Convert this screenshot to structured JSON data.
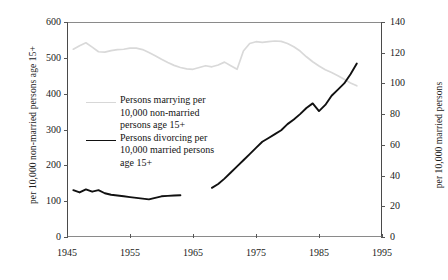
{
  "axes": {
    "left_title": "per 10,000 non-married persons age 15+",
    "right_title": "per 10,000 married persons",
    "left_ticks": [
      "600",
      "500",
      "400",
      "300",
      "200",
      "100",
      "0"
    ],
    "right_ticks": [
      "140",
      "120",
      "100",
      "80",
      "60",
      "40",
      "20",
      "0"
    ],
    "x_ticks": [
      "1945",
      "1955",
      "1965",
      "1975",
      "1985",
      "1995"
    ]
  },
  "legend": {
    "marry_label": "Persons marrying per\n10,000 non-married\npersons age 15+",
    "divorce_label": "Persons divorcing per\n10,000 married persons\nage 15+"
  },
  "chart_data": {
    "type": "line",
    "title": "",
    "xlabel": "",
    "ylabel": "per 10,000 non-married persons age 15+",
    "ylabel_right": "per 10,000 married persons",
    "xlim": [
      1945,
      1995
    ],
    "ylim": [
      0,
      600
    ],
    "ylim_right": [
      0,
      140
    ],
    "grid": false,
    "legend_position": "inside-center-left",
    "colors": {
      "marry": "#d9d9d9",
      "divorce": "#111111"
    },
    "series": [
      {
        "name": "Persons marrying per 10,000 non-married persons age 15+",
        "axis": "left",
        "color": "#d9d9d9",
        "x": [
          1946,
          1947,
          1948,
          1949,
          1950,
          1951,
          1952,
          1953,
          1954,
          1955,
          1956,
          1957,
          1958,
          1959,
          1960,
          1961,
          1962,
          1963,
          1964,
          1965,
          1966,
          1967,
          1968,
          1969,
          1970,
          1971,
          1972,
          1973,
          1974,
          1975,
          1976,
          1977,
          1978,
          1979,
          1980,
          1981,
          1982,
          1983,
          1984,
          1985,
          1986,
          1987,
          1988,
          1989,
          1990,
          1991
        ],
        "values": [
          524,
          534,
          542,
          530,
          517,
          516,
          520,
          523,
          524,
          527,
          527,
          523,
          515,
          506,
          496,
          487,
          479,
          473,
          469,
          468,
          473,
          478,
          475,
          480,
          488,
          478,
          468,
          519,
          540,
          545,
          543,
          545,
          547,
          546,
          540,
          531,
          519,
          503,
          489,
          477,
          467,
          459,
          450,
          440,
          430,
          422
        ]
      },
      {
        "name": "Persons divorcing per 10,000 married persons age 15+ (early segment)",
        "axis": "right",
        "color": "#111111",
        "x": [
          1946,
          1947,
          1948,
          1949,
          1950,
          1951,
          1952,
          1953,
          1954,
          1955,
          1956,
          1957,
          1958,
          1959,
          1960,
          1961,
          1962,
          1963
        ],
        "values": [
          30.5,
          29.0,
          31.0,
          29.5,
          30.5,
          28.5,
          27.5,
          27.0,
          26.5,
          26.0,
          25.5,
          25.0,
          24.5,
          25.5,
          26.5,
          26.8,
          27.0,
          27.2
        ]
      },
      {
        "name": "Persons divorcing per 10,000 married persons age 15+ (later segment)",
        "axis": "right",
        "color": "#111111",
        "x": [
          1968,
          1969,
          1970,
          1971,
          1972,
          1973,
          1974,
          1975,
          1976,
          1977,
          1978,
          1979,
          1980,
          1981,
          1982,
          1983,
          1984,
          1985,
          1986,
          1987,
          1988,
          1989,
          1990,
          1991
        ],
        "values": [
          32.0,
          34.5,
          38.0,
          42.0,
          46.0,
          50.0,
          54.0,
          58.0,
          62.0,
          64.5,
          67.0,
          69.5,
          73.5,
          76.5,
          80.0,
          84.0,
          87.0,
          82.0,
          86.0,
          92.0,
          96.0,
          100.0,
          106.0,
          113.0
        ]
      }
    ]
  }
}
